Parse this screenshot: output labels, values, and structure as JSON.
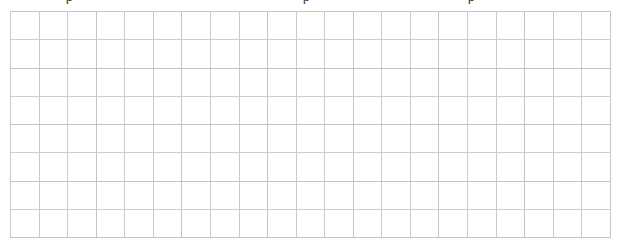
{
  "page": {
    "background_color": "#ffffff",
    "width": 623,
    "height": 246
  },
  "clipped_header": {
    "description": "text line cropped off the top edge of the screenshot; only descender fragments remain visible",
    "fragments": [
      {
        "text": "p",
        "x": 66
      },
      {
        "text": "p",
        "x": 303
      },
      {
        "text": "p",
        "x": 468
      }
    ]
  },
  "grid": {
    "type": "table",
    "columns": 21,
    "rows": 8,
    "cell_width": 28.57,
    "cell_height": 28.25,
    "origin_x": 10,
    "origin_y": 11,
    "line_color": "#c9c9c9",
    "cell_background": "#ffffff",
    "empty": true,
    "cells": [
      [
        "",
        "",
        "",
        "",
        "",
        "",
        "",
        "",
        "",
        "",
        "",
        "",
        "",
        "",
        "",
        "",
        "",
        "",
        "",
        "",
        ""
      ],
      [
        "",
        "",
        "",
        "",
        "",
        "",
        "",
        "",
        "",
        "",
        "",
        "",
        "",
        "",
        "",
        "",
        "",
        "",
        "",
        "",
        ""
      ],
      [
        "",
        "",
        "",
        "",
        "",
        "",
        "",
        "",
        "",
        "",
        "",
        "",
        "",
        "",
        "",
        "",
        "",
        "",
        "",
        "",
        ""
      ],
      [
        "",
        "",
        "",
        "",
        "",
        "",
        "",
        "",
        "",
        "",
        "",
        "",
        "",
        "",
        "",
        "",
        "",
        "",
        "",
        "",
        ""
      ],
      [
        "",
        "",
        "",
        "",
        "",
        "",
        "",
        "",
        "",
        "",
        "",
        "",
        "",
        "",
        "",
        "",
        "",
        "",
        "",
        "",
        ""
      ],
      [
        "",
        "",
        "",
        "",
        "",
        "",
        "",
        "",
        "",
        "",
        "",
        "",
        "",
        "",
        "",
        "",
        "",
        "",
        "",
        "",
        ""
      ],
      [
        "",
        "",
        "",
        "",
        "",
        "",
        "",
        "",
        "",
        "",
        "",
        "",
        "",
        "",
        "",
        "",
        "",
        "",
        "",
        "",
        ""
      ],
      [
        "",
        "",
        "",
        "",
        "",
        "",
        "",
        "",
        "",
        "",
        "",
        "",
        "",
        "",
        "",
        "",
        "",
        "",
        "",
        "",
        ""
      ]
    ]
  }
}
